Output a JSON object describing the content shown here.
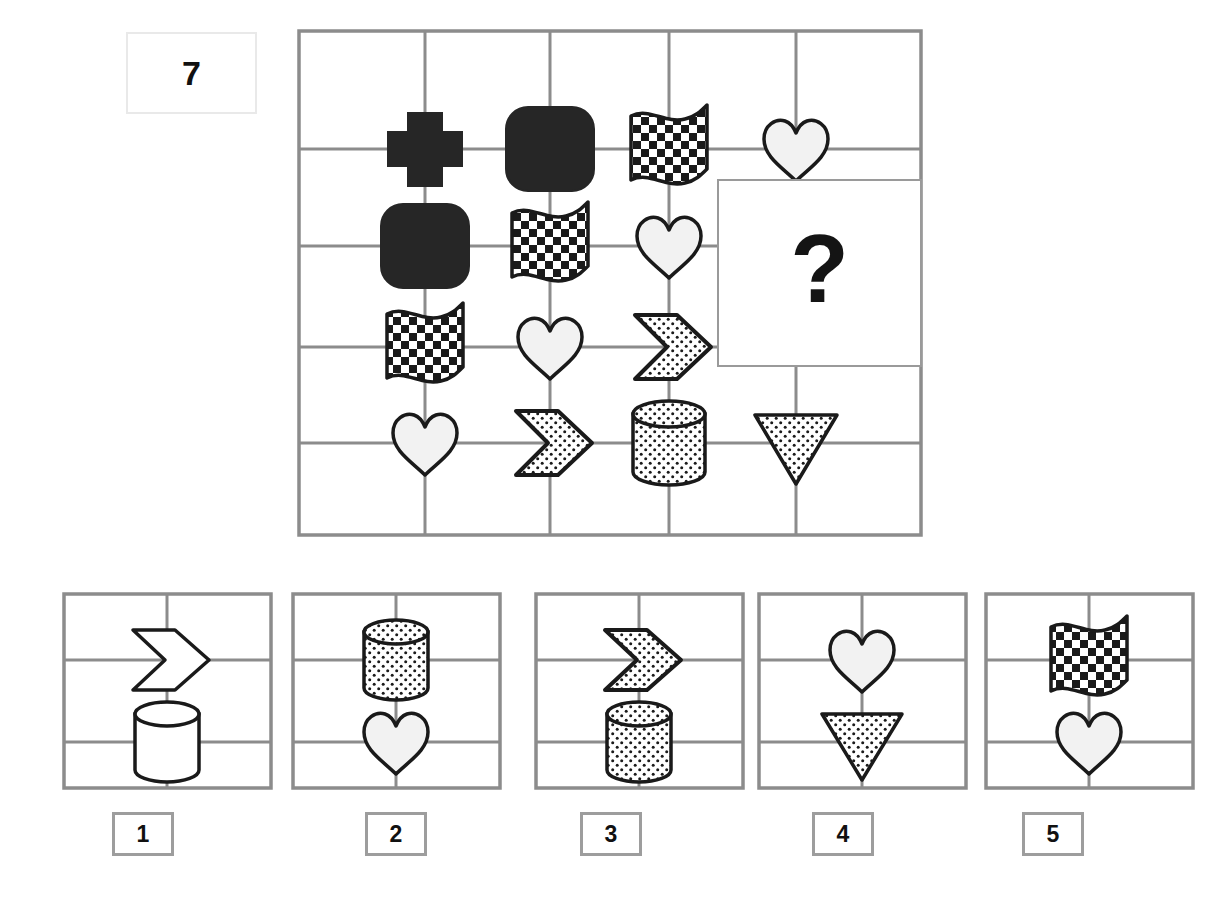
{
  "item": {
    "number": "7",
    "question_mark": "?"
  },
  "colors": {
    "grid_line": "#8c8c8c",
    "shape_outline": "#1a1a1a",
    "fill_black": "#262626",
    "fill_white": "#f2f2f2",
    "label_border": "#9d9d9d",
    "background": "#ffffff"
  },
  "matrix": {
    "name": "matrix-grid",
    "rows": 4,
    "cols": 5,
    "cells": [
      {
        "row": 1,
        "col": 1,
        "shape": "cross",
        "fill": "black"
      },
      {
        "row": 1,
        "col": 2,
        "shape": "cylinder",
        "fill": "black"
      },
      {
        "row": 1,
        "col": 3,
        "shape": "flag",
        "fill": "checkered"
      },
      {
        "row": 1,
        "col": 4,
        "shape": "heart",
        "fill": "white"
      },
      {
        "row": 2,
        "col": 1,
        "shape": "cylinder",
        "fill": "black"
      },
      {
        "row": 2,
        "col": 2,
        "shape": "flag",
        "fill": "checkered"
      },
      {
        "row": 2,
        "col": 3,
        "shape": "heart",
        "fill": "white"
      },
      {
        "row": 2,
        "col": 4,
        "shape": "question",
        "fill": "none"
      },
      {
        "row": 3,
        "col": 1,
        "shape": "flag",
        "fill": "checkered"
      },
      {
        "row": 3,
        "col": 2,
        "shape": "heart",
        "fill": "white"
      },
      {
        "row": 3,
        "col": 3,
        "shape": "chevron",
        "fill": "dotted"
      },
      {
        "row": 4,
        "col": 1,
        "shape": "heart",
        "fill": "white"
      },
      {
        "row": 4,
        "col": 2,
        "shape": "chevron",
        "fill": "dotted"
      },
      {
        "row": 4,
        "col": 3,
        "shape": "cylinder",
        "fill": "dotted"
      },
      {
        "row": 4,
        "col": 4,
        "shape": "triangle-down",
        "fill": "dotted"
      }
    ]
  },
  "options": [
    {
      "label": "1",
      "name": "answer-option-1",
      "shapes": [
        {
          "slot": "top",
          "shape": "chevron",
          "fill": "white"
        },
        {
          "slot": "bottom",
          "shape": "cylinder",
          "fill": "white"
        }
      ]
    },
    {
      "label": "2",
      "name": "answer-option-2",
      "shapes": [
        {
          "slot": "top",
          "shape": "cylinder",
          "fill": "dotted"
        },
        {
          "slot": "bottom",
          "shape": "heart",
          "fill": "white"
        }
      ]
    },
    {
      "label": "3",
      "name": "answer-option-3",
      "shapes": [
        {
          "slot": "top",
          "shape": "chevron",
          "fill": "dotted"
        },
        {
          "slot": "bottom",
          "shape": "cylinder",
          "fill": "dotted"
        }
      ]
    },
    {
      "label": "4",
      "name": "answer-option-4",
      "shapes": [
        {
          "slot": "top",
          "shape": "heart",
          "fill": "white"
        },
        {
          "slot": "bottom",
          "shape": "triangle-down",
          "fill": "dotted"
        }
      ]
    },
    {
      "label": "5",
      "name": "answer-option-5",
      "shapes": [
        {
          "slot": "top",
          "shape": "flag",
          "fill": "checkered"
        },
        {
          "slot": "bottom",
          "shape": "heart",
          "fill": "white"
        }
      ]
    }
  ]
}
